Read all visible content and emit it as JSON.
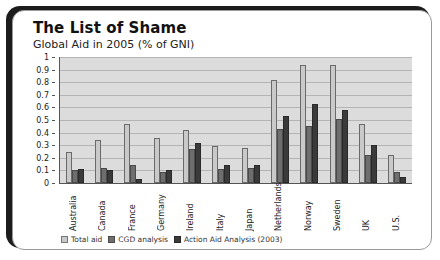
{
  "card": {
    "title": "The List of Shame",
    "subtitle": "Global Aid in 2005 (% of GNI)"
  },
  "chart_data": {
    "type": "bar",
    "title": "The List of Shame",
    "subtitle": "Global Aid in 2005 (% of GNI)",
    "xlabel": "",
    "ylabel": "",
    "ylim": [
      0,
      1
    ],
    "yticks": [
      0,
      0.1,
      0.2,
      0.3,
      0.4,
      0.5,
      0.6,
      0.7,
      0.8,
      0.9,
      1
    ],
    "ytick_labels": [
      "0",
      "0.1",
      "0.2",
      "0.3",
      "0.4",
      "0.5",
      "0.6",
      "0.7",
      "0.8",
      "0.9",
      "1"
    ],
    "grid": true,
    "legend_position": "bottom",
    "categories": [
      "Australia",
      "Canada",
      "France",
      "Germany",
      "Ireland",
      "Italy",
      "Japan",
      "Netherlands",
      "Norway",
      "Sweden",
      "UK",
      "U.S."
    ],
    "series": [
      {
        "name": "Total aid",
        "color": "#c9c9c9",
        "values": [
          0.25,
          0.34,
          0.47,
          0.36,
          0.42,
          0.29,
          0.28,
          0.82,
          0.94,
          0.94,
          0.47,
          0.22
        ]
      },
      {
        "name": "CGD analysis",
        "color": "#6e6e6e",
        "values": [
          0.1,
          0.12,
          0.14,
          0.09,
          0.27,
          0.11,
          0.12,
          0.43,
          0.45,
          0.51,
          0.22,
          0.09
        ]
      },
      {
        "name": "Action Aid Analysis (2003)",
        "color": "#3a3a3a",
        "values": [
          0.11,
          0.1,
          0.03,
          0.1,
          0.32,
          0.14,
          0.14,
          0.53,
          0.63,
          0.58,
          0.3,
          0.05
        ]
      }
    ]
  }
}
